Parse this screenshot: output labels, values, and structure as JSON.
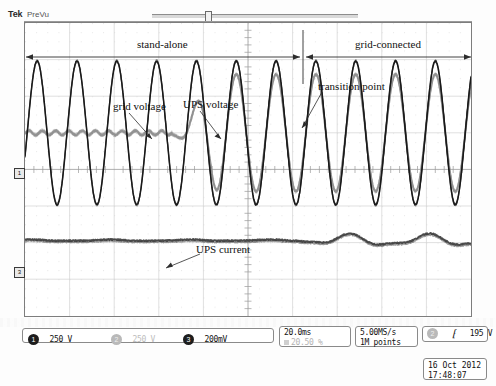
{
  "instrument": {
    "brand": "Tek",
    "mode": "PreVu",
    "position_marker_label": "u"
  },
  "annotations": {
    "stand_alone": "stand-alone",
    "grid_connected": "grid-connected",
    "grid_voltage": "grid voltage",
    "ups_voltage": "UPS voltage",
    "transition_point": "transition point",
    "ups_current": "UPS current"
  },
  "channels": [
    {
      "id": "1",
      "label": "250 V",
      "active": true
    },
    {
      "id": "2",
      "label": "250 V",
      "active": false
    },
    {
      "id": "3",
      "label": "200mV",
      "active": true
    }
  ],
  "horizontal": {
    "timebase": "20.0ms",
    "position": "20.50 %"
  },
  "acquisition": {
    "sample_rate": "5.00MS/s",
    "record_length": "1M points"
  },
  "trigger": {
    "source": "2",
    "slope": "rising-edge",
    "level": "195 V"
  },
  "timestamp": {
    "date": "16 Oct  2012",
    "time": "17:48:07"
  },
  "markers": {
    "channel_1": "1",
    "channel_3": "3",
    "trigger_level": "T"
  },
  "chart_data": {
    "type": "line",
    "xlabel": "time",
    "ylabel": "voltage / current",
    "grid": true,
    "graticule": {
      "divisions_x": 10,
      "divisions_y": 8,
      "time_per_div": "20.0ms"
    },
    "transition_point_div": 6.25,
    "regions": [
      {
        "name": "stand-alone",
        "from_div": 0.0,
        "to_div": 6.25
      },
      {
        "name": "grid-connected",
        "from_div": 6.25,
        "to_div": 10.0
      }
    ],
    "series": [
      {
        "name": "grid voltage",
        "channel": "1",
        "color": "#1a1a1a",
        "center_div_y": 5.0,
        "amplitude_div": 1.85,
        "cycles": 11.2,
        "note": "continuous sine across entire record"
      },
      {
        "name": "UPS voltage",
        "channel": "2",
        "color": "#8f8f8f",
        "center_div_y": 5.0,
        "amplitude_div_before": 0.06,
        "amplitude_div_after": 1.6,
        "ramp_start_div": 3.3,
        "ramp_end_div": 4.4,
        "note": "flat during stand-alone, synchronises and matches grid after transition"
      },
      {
        "name": "UPS current",
        "channel": "3",
        "color": "#3a3a3a",
        "center_div_y": 2.05,
        "amplitude_div_before": 0.02,
        "amplitude_div_after": 0.17,
        "ripple_start_div": 6.1,
        "note": "near zero in stand-alone, small ripple once grid-connected"
      }
    ]
  }
}
